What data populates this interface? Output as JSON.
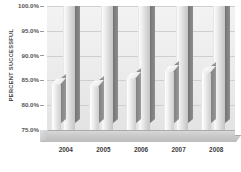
{
  "chart_data": {
    "type": "bar",
    "title": "",
    "subtitle": "",
    "xlabel": "",
    "ylabel": "PERCENT SUCCESSFUL",
    "categories": [
      "2004",
      "2005",
      "2006",
      "2007",
      "2008"
    ],
    "ylim": [
      75.0,
      100.0
    ],
    "ytick_labels": [
      "100.0%",
      "95.0%",
      "90.0%",
      "85.0%",
      "80.0%",
      "75.0%"
    ],
    "ytick_values": [
      100.0,
      95.0,
      90.0,
      85.0,
      80.0,
      75.0
    ],
    "grid": true,
    "legend": null,
    "legend_position": "none",
    "style": "3d-column",
    "series": [
      {
        "name": "front",
        "values": [
          84.0,
          83.6,
          85.2,
          86.6,
          86.4
        ]
      },
      {
        "name": "back",
        "values": [
          100.0,
          100.0,
          100.0,
          100.0,
          100.0
        ]
      }
    ],
    "annotations": []
  },
  "axis": {
    "y_title": "PERCENT SUCCESSFUL",
    "ticks": [
      {
        "label": "100.0%",
        "value": 100.0
      },
      {
        "label": "95.0%",
        "value": 95.0
      },
      {
        "label": "90.0%",
        "value": 90.0
      },
      {
        "label": "85.0%",
        "value": 85.0
      },
      {
        "label": "80.0%",
        "value": 80.0
      },
      {
        "label": "75.0%",
        "value": 75.0
      }
    ],
    "x_labels": [
      "2004",
      "2005",
      "2006",
      "2007",
      "2008"
    ]
  },
  "colors": {
    "bar_face_light": "#f6f6f6",
    "bar_face_dark": "#cdcdcd",
    "bar_side": "#8c8c8c",
    "plot_background": "#ebebeb",
    "gridline": "#cfcfcf",
    "floor": "#c9c9c9",
    "text": "#3d3d3d"
  }
}
